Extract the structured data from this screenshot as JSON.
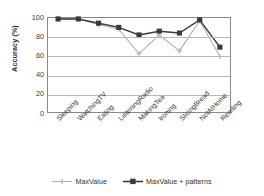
{
  "chart_data": {
    "type": "line",
    "title": "",
    "xlabel": "",
    "ylabel": "Accuracy (%)",
    "ylim": [
      0,
      100
    ],
    "yticks": [
      0,
      20,
      40,
      60,
      80,
      100
    ],
    "grid": true,
    "legend_position": "bottom",
    "categories": [
      "Sleeping",
      "WatchingTV",
      "Eating",
      "ListeningRadio",
      "MakingTea",
      "Ironing",
      "SlicingBread",
      "NotAtHome",
      "Reading"
    ],
    "series": [
      {
        "name": "MaxValue",
        "color": "#b0b0b0",
        "marker": "plus",
        "values": [
          99,
          99,
          93,
          88,
          62,
          82,
          65,
          97,
          59
        ]
      },
      {
        "name": "MaxValue + patterns",
        "color": "#3a3a3a",
        "marker": "square",
        "values": [
          99,
          99,
          94.5,
          90,
          82,
          86,
          84,
          98,
          69
        ]
      }
    ]
  },
  "axis": {
    "y_title": "Accuracy (%)",
    "y_tick_labels": [
      "100",
      "80",
      "60",
      "40",
      "20",
      "0"
    ]
  },
  "legend": {
    "items": [
      {
        "label": "MaxValue",
        "color": "#b0b0b0",
        "marker": "plus"
      },
      {
        "label": "MaxValue + patterns",
        "color": "#3a3a3a",
        "marker": "square"
      }
    ]
  }
}
